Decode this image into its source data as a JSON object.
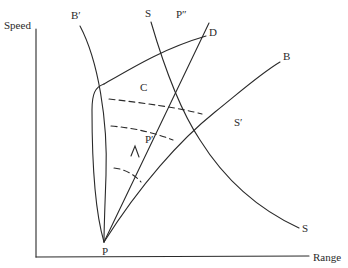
{
  "diagram": {
    "type": "speed-range trajectory diagram",
    "axes": {
      "y_label": "Speed",
      "x_label": "Range"
    },
    "labels": {
      "b_prime": "B′",
      "s_top": "S",
      "p_double_prime": "P″",
      "d": "D",
      "b": "B",
      "c": "C",
      "s_prime": "S′",
      "p_prime": "P′",
      "s_bottom": "S",
      "p": "P"
    },
    "curves": [
      {
        "name": "B'-curve",
        "from": "B'",
        "to": "P"
      },
      {
        "name": "S-curve",
        "from": "S (top)",
        "to": "S (bottom)"
      },
      {
        "name": "P-P''-line",
        "from": "P",
        "to": "P''",
        "arrow_at": "P'"
      },
      {
        "name": "B-curve",
        "from": "P",
        "to": "B"
      },
      {
        "name": "envelope-D",
        "from": "P",
        "to": "D"
      },
      {
        "name": "dashed-arcs",
        "count": 3
      }
    ],
    "colors": {
      "ink": "#2a2a2a",
      "background": "#ffffff"
    }
  }
}
